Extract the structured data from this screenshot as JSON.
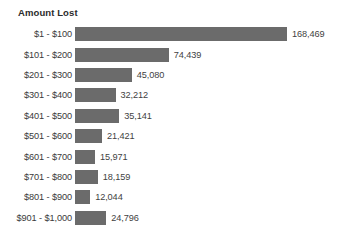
{
  "chart_data": {
    "type": "bar",
    "orientation": "horizontal",
    "title": "Amount Lost",
    "xlabel": "",
    "ylabel": "",
    "grid": false,
    "legend": false,
    "xlim": [
      0,
      168469
    ],
    "categories": [
      "$1 - $100",
      "$101 - $200",
      "$201 - $300",
      "$301 - $400",
      "$401 - $500",
      "$501 - $600",
      "$601 - $700",
      "$701 - $800",
      "$801 - $900",
      "$901 - $1,000"
    ],
    "values": [
      168469,
      74439,
      45080,
      32212,
      35141,
      21421,
      15971,
      18159,
      12044,
      24796
    ],
    "value_labels": [
      "168,469",
      "74,439",
      "45,080",
      "32,212",
      "35,141",
      "21,421",
      "15,971",
      "18,159",
      "12,044",
      "24,796"
    ],
    "bar_color": "#6b6b6b",
    "label_color": "#3a3a3a",
    "background_color": "#ffffff"
  }
}
